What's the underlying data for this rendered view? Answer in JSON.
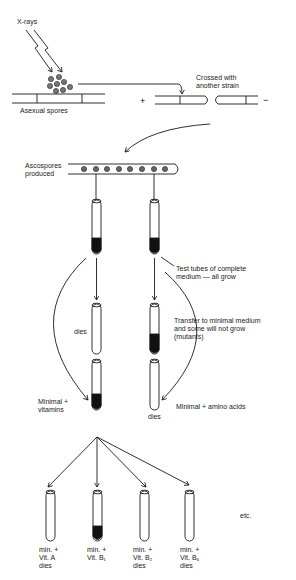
{
  "diagram": {
    "xrays_label": "X-rays",
    "asexual_spores_label": "Asexual spores",
    "plus_sign": "+",
    "minus_sign": "−",
    "crossed_label": "Crossed with\nanother strain",
    "ascospores_label": "Ascospores\nproduced",
    "test_tubes_label": "Test tubes of complete\nmedium — all grow",
    "transfer_label": "Transfer to minimal medium\nand some will not grow\n(mutants)",
    "dies_label_left": "dies",
    "dies_label_right": "dies",
    "minimal_vitamins_label": "Minimal +\nvitamins",
    "minimal_amino_label": "Minimal + amino acids",
    "etc_label": "etc.",
    "bottom_tubes": [
      {
        "label": "min. +\nVit. A\ndies",
        "growth": false
      },
      {
        "label": "min. +\nVit. B₁",
        "growth": true
      },
      {
        "label": "min. +\nVit. B₂\ndies",
        "growth": false
      },
      {
        "label": "min. +\nVit. B₆\ndies",
        "growth": false
      }
    ],
    "colors": {
      "ink": "#1a1a1a",
      "spore": "#777777",
      "fill": "#111111"
    }
  }
}
